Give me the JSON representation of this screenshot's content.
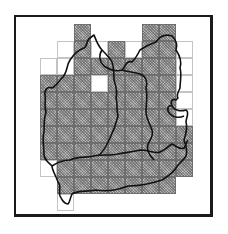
{
  "map": {
    "description": "Gridded region map with shaded and unshaded grid squares overlaid by region boundary outlines",
    "cell_size_px": 17,
    "origin_px": [
      40,
      24
    ],
    "colors": {
      "shaded": "#b5b5b5",
      "unshaded": "#ffffff",
      "grid_line": "#6e6e6e",
      "boundary": "#111111",
      "frame": "#1a1a1a"
    },
    "legend": {
      "s": "shaded grid square",
      "w": "unshaded grid square"
    },
    "rows": [
      {
        "row": 0,
        "cells": [
          [
            2,
            "s"
          ],
          [
            6,
            "s"
          ],
          [
            7,
            "s"
          ]
        ]
      },
      {
        "row": 1,
        "cells": [
          [
            1,
            "w"
          ],
          [
            2,
            "s"
          ],
          [
            3,
            "w"
          ],
          [
            4,
            "s"
          ],
          [
            5,
            "w"
          ],
          [
            6,
            "s"
          ],
          [
            7,
            "s"
          ],
          [
            8,
            "w"
          ]
        ]
      },
      {
        "row": 2,
        "cells": [
          [
            0,
            "w"
          ],
          [
            1,
            "w"
          ],
          [
            2,
            "s"
          ],
          [
            3,
            "s"
          ],
          [
            4,
            "s"
          ],
          [
            5,
            "s"
          ],
          [
            6,
            "s"
          ],
          [
            7,
            "s"
          ],
          [
            8,
            "w"
          ]
        ]
      },
      {
        "row": 3,
        "cells": [
          [
            0,
            "s"
          ],
          [
            1,
            "s"
          ],
          [
            2,
            "s"
          ],
          [
            3,
            "w"
          ],
          [
            4,
            "s"
          ],
          [
            5,
            "s"
          ],
          [
            6,
            "s"
          ],
          [
            7,
            "s"
          ],
          [
            8,
            "w"
          ]
        ]
      },
      {
        "row": 4,
        "cells": [
          [
            0,
            "s"
          ],
          [
            1,
            "s"
          ],
          [
            2,
            "s"
          ],
          [
            3,
            "s"
          ],
          [
            4,
            "s"
          ],
          [
            5,
            "s"
          ],
          [
            6,
            "s"
          ],
          [
            7,
            "s"
          ],
          [
            8,
            "w"
          ]
        ]
      },
      {
        "row": 5,
        "cells": [
          [
            0,
            "s"
          ],
          [
            1,
            "s"
          ],
          [
            2,
            "s"
          ],
          [
            3,
            "s"
          ],
          [
            4,
            "s"
          ],
          [
            5,
            "s"
          ],
          [
            6,
            "s"
          ],
          [
            7,
            "s"
          ],
          [
            8,
            "w"
          ]
        ]
      },
      {
        "row": 6,
        "cells": [
          [
            0,
            "s"
          ],
          [
            1,
            "s"
          ],
          [
            2,
            "s"
          ],
          [
            3,
            "s"
          ],
          [
            4,
            "s"
          ],
          [
            5,
            "s"
          ],
          [
            6,
            "s"
          ],
          [
            7,
            "s"
          ],
          [
            8,
            "s"
          ]
        ]
      },
      {
        "row": 7,
        "cells": [
          [
            0,
            "s"
          ],
          [
            1,
            "s"
          ],
          [
            2,
            "s"
          ],
          [
            3,
            "s"
          ],
          [
            4,
            "s"
          ],
          [
            5,
            "s"
          ],
          [
            6,
            "s"
          ],
          [
            7,
            "s"
          ],
          [
            8,
            "s"
          ]
        ]
      },
      {
        "row": 8,
        "cells": [
          [
            0,
            "w"
          ],
          [
            1,
            "s"
          ],
          [
            2,
            "s"
          ],
          [
            3,
            "s"
          ],
          [
            4,
            "s"
          ],
          [
            5,
            "s"
          ],
          [
            6,
            "s"
          ],
          [
            7,
            "s"
          ],
          [
            8,
            "s"
          ]
        ]
      },
      {
        "row": 9,
        "cells": [
          [
            1,
            "s"
          ],
          [
            2,
            "s"
          ],
          [
            3,
            "s"
          ],
          [
            4,
            "s"
          ],
          [
            5,
            "s"
          ],
          [
            6,
            "s"
          ],
          [
            7,
            "s"
          ]
        ]
      },
      {
        "row": 10,
        "cells": [
          [
            1,
            "w"
          ]
        ]
      }
    ],
    "regions": [
      "north-west region",
      "north-east region",
      "south region"
    ]
  }
}
